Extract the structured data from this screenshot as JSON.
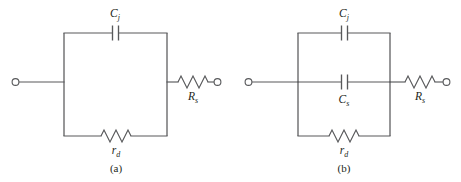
{
  "figure": {
    "background_color": "#ffffff",
    "line_color": "#58595b",
    "text_color": "#231f20",
    "panels": [
      {
        "id": "panel-a",
        "caption": "(a)",
        "components": [
          {
            "id": "cj",
            "type": "capacitor",
            "symbol": "capacitor-symbol",
            "base": "C",
            "subscript": "j",
            "label": "Cj",
            "branch": "top",
            "label_position": "above"
          },
          {
            "id": "rd",
            "type": "resistor",
            "symbol": "resistor-symbol",
            "base": "r",
            "subscript": "d",
            "label": "rd",
            "branch": "bottom",
            "label_position": "below"
          },
          {
            "id": "rs",
            "type": "resistor",
            "symbol": "resistor-symbol",
            "base": "R",
            "subscript": "s",
            "label": "Rs",
            "branch": "series-right",
            "label_position": "below"
          }
        ],
        "terminals": [
          "left-terminal",
          "right-terminal"
        ]
      },
      {
        "id": "panel-b",
        "caption": "(b)",
        "components": [
          {
            "id": "cj",
            "type": "capacitor",
            "symbol": "capacitor-symbol",
            "base": "C",
            "subscript": "j",
            "label": "Cj",
            "branch": "top",
            "label_position": "above"
          },
          {
            "id": "cs",
            "type": "capacitor",
            "symbol": "capacitor-symbol",
            "base": "C",
            "subscript": "s",
            "label": "Cs",
            "branch": "middle",
            "label_position": "below"
          },
          {
            "id": "rd",
            "type": "resistor",
            "symbol": "resistor-symbol",
            "base": "r",
            "subscript": "d",
            "label": "rd",
            "branch": "bottom",
            "label_position": "below"
          },
          {
            "id": "rs",
            "type": "resistor",
            "symbol": "resistor-symbol",
            "base": "R",
            "subscript": "s",
            "label": "Rs",
            "branch": "series-right",
            "label_position": "below"
          }
        ],
        "terminals": [
          "left-terminal",
          "right-terminal"
        ]
      }
    ]
  }
}
